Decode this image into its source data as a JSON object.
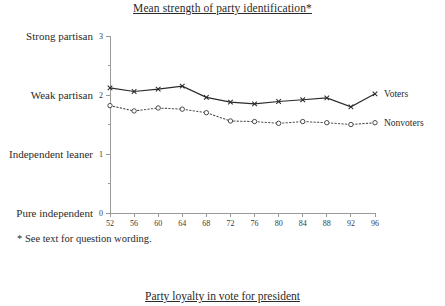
{
  "figure": {
    "title": "Mean strength of party identification*",
    "footnote": "* See text for question wording.",
    "bottom_caption": "Party loyalty in vote for president"
  },
  "chart_data": {
    "type": "line",
    "title": "Mean strength of party identification*",
    "xlabel": "",
    "ylabel": "",
    "xlim": [
      52,
      96
    ],
    "ylim": [
      0,
      3
    ],
    "grid": false,
    "legend_position": "right-inline",
    "x": [
      52,
      56,
      60,
      64,
      68,
      72,
      76,
      80,
      84,
      88,
      92,
      96
    ],
    "xtick_labels": [
      "52",
      "56",
      "60",
      "64",
      "68",
      "72",
      "76",
      "80",
      "84",
      "88",
      "92",
      "96"
    ],
    "ytick_values": [
      0,
      1,
      2,
      3
    ],
    "ytick_labels": [
      "0",
      "1",
      "2",
      "3"
    ],
    "ycategory_labels": [
      {
        "value": 3,
        "label": "Strong partisan"
      },
      {
        "value": 2,
        "label": "Weak partisan"
      },
      {
        "value": 1,
        "label": "Independent leaner"
      },
      {
        "value": 0,
        "label": "Pure independent"
      }
    ],
    "series": [
      {
        "name": "Voters",
        "marker": "x",
        "linestyle": "solid",
        "color": "#2b2b2b",
        "values": [
          2.12,
          2.06,
          2.1,
          2.15,
          1.96,
          1.88,
          1.85,
          1.89,
          1.92,
          1.95,
          1.8,
          2.02
        ]
      },
      {
        "name": "Nonvoters",
        "marker": "o",
        "linestyle": "dotted",
        "color": "#4a4a4a",
        "values": [
          1.82,
          1.73,
          1.78,
          1.76,
          1.7,
          1.56,
          1.55,
          1.52,
          1.55,
          1.53,
          1.5,
          1.53
        ]
      }
    ]
  }
}
